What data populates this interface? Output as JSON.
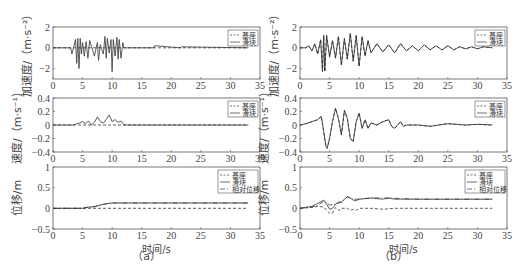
{
  "chart_data": [
    {
      "id": "a-acc",
      "panel": "a",
      "type": "line",
      "ylabel": "加速度/（m·s⁻²）",
      "xlabel": "",
      "xlim": [
        0,
        35
      ],
      "ylim": [
        -3,
        2
      ],
      "xticks": [
        0,
        5,
        10,
        15,
        20,
        25,
        30,
        35
      ],
      "yticks": [
        2,
        0,
        -2
      ],
      "legend": [
        "基座",
        "滑块"
      ],
      "legend_position": "upper right",
      "series": [
        {
          "name": "基座",
          "style": "dashed",
          "x": [
            0,
            3,
            33
          ],
          "y": [
            0,
            0,
            0
          ]
        },
        {
          "name": "滑块",
          "style": "solid",
          "x": [
            0,
            3,
            3.2,
            3.8,
            4,
            4.2,
            4.4,
            4.6,
            4.8,
            5,
            5.3,
            5.6,
            5.9,
            6.2,
            7,
            7.5,
            7.7,
            8,
            8.5,
            8.8,
            9,
            9.2,
            9.5,
            9.8,
            10,
            10.2,
            10.5,
            10.8,
            11,
            11.2,
            11.5,
            11.8,
            12,
            17,
            17.2,
            21.5,
            21.7,
            33
          ],
          "y": [
            0,
            0,
            -0.6,
            0.8,
            -1.5,
            0.9,
            -2,
            0.9,
            -0.6,
            0.5,
            -0.8,
            0.6,
            -1,
            0.7,
            -0.8,
            0.5,
            -1.2,
            0.3,
            -0.6,
            1.1,
            -1,
            0.9,
            -0.5,
            0.8,
            -2.3,
            0.8,
            -0.8,
            1,
            -1.1,
            0.8,
            -1,
            0.5,
            0,
            0,
            0.2,
            0,
            0.1,
            0
          ]
        }
      ]
    },
    {
      "id": "b-acc",
      "panel": "b",
      "type": "line",
      "ylabel": "加速度/（m·s⁻²）",
      "xlabel": "",
      "xlim": [
        0,
        35
      ],
      "ylim": [
        -3,
        2
      ],
      "xticks": [
        0,
        5,
        10,
        15,
        20,
        25,
        30,
        35
      ],
      "yticks": [
        2,
        0,
        -2
      ],
      "legend": [
        "基座",
        "滑块"
      ],
      "legend_position": "upper right",
      "series": [
        {
          "name": "基座",
          "style": "dashed",
          "x": [
            0,
            1,
            1.5,
            2,
            2.5,
            3,
            3.5,
            3.8,
            4,
            4.2,
            4.5,
            5,
            5.5,
            6,
            6.5,
            7,
            7.5,
            8,
            8.5,
            9,
            9.5,
            10,
            10.5,
            11,
            11.5,
            12,
            13,
            14,
            15,
            16,
            17,
            18,
            19,
            20,
            21,
            22,
            23,
            24,
            25,
            26,
            27,
            28,
            29,
            30,
            31,
            32.5
          ],
          "y": [
            0,
            0,
            0.2,
            -0.3,
            0.4,
            -0.6,
            0.8,
            -2.3,
            1.2,
            -2.3,
            1.2,
            -0.9,
            0.7,
            -1,
            1.1,
            -1.7,
            0.9,
            -1.1,
            1.4,
            -1.3,
            1.2,
            -1.8,
            1.1,
            -0.8,
            0.7,
            -0.5,
            0.4,
            -0.4,
            0.3,
            -0.5,
            0.4,
            -0.3,
            0.2,
            -0.3,
            0.3,
            -0.2,
            0.2,
            -0.2,
            0.2,
            -0.2,
            0.1,
            -0.1,
            0.1,
            -0.1,
            0.1,
            0
          ]
        },
        {
          "name": "滑块",
          "style": "solid",
          "note": "nearly coincides with 基座"
        }
      ]
    },
    {
      "id": "a-vel",
      "panel": "a",
      "type": "line",
      "ylabel": "速度/（m·s⁻¹）",
      "xlabel": "",
      "xlim": [
        0,
        35
      ],
      "ylim": [
        -0.4,
        0.4
      ],
      "xticks": [
        0,
        5,
        10,
        15,
        20,
        25,
        30,
        35
      ],
      "yticks": [
        0.4,
        0.2,
        0,
        -0.2,
        -0.4
      ],
      "legend": [
        "基座",
        "滑块"
      ],
      "legend_position": "upper right",
      "series": [
        {
          "name": "基座",
          "style": "dashed",
          "x": [
            0,
            33
          ],
          "y": [
            0,
            0
          ]
        },
        {
          "name": "滑块",
          "style": "solid",
          "x": [
            0,
            3.5,
            4,
            4.5,
            5,
            5.5,
            6,
            6.5,
            7,
            7.5,
            8,
            8.5,
            9,
            9.5,
            10,
            10.5,
            11,
            11.5,
            12,
            33
          ],
          "y": [
            0,
            0,
            0.02,
            0.03,
            0.05,
            0.02,
            0.06,
            0,
            0.04,
            0.12,
            0.05,
            0.03,
            0.08,
            0.15,
            0.05,
            0.08,
            0.04,
            0.06,
            0,
            0
          ]
        }
      ]
    },
    {
      "id": "b-vel",
      "panel": "b",
      "type": "line",
      "ylabel": "速度/（m·s⁻¹）",
      "xlabel": "",
      "xlim": [
        0,
        35
      ],
      "ylim": [
        -0.4,
        0.4
      ],
      "xticks": [
        0,
        5,
        10,
        15,
        20,
        25,
        30,
        35
      ],
      "yticks": [
        0.4,
        0.2,
        0,
        -0.2,
        -0.4
      ],
      "legend": [
        "基座",
        "滑块"
      ],
      "legend_position": "upper right",
      "series": [
        {
          "name": "基座",
          "style": "dashed",
          "x": [
            0,
            1,
            2,
            3,
            3.6,
            4,
            4.4,
            4.6,
            5,
            5.5,
            6,
            6.5,
            7,
            7.5,
            8,
            8.5,
            9,
            9.5,
            10,
            10.5,
            11,
            11.5,
            12,
            13,
            14,
            15,
            15.5,
            16,
            17,
            17.5,
            18,
            20,
            22,
            25,
            28,
            30,
            32.5
          ],
          "y": [
            0,
            0.02,
            0.05,
            0.08,
            0.13,
            -0.1,
            -0.33,
            -0.35,
            -0.2,
            0.05,
            0.25,
            0.1,
            -0.15,
            0.22,
            0.1,
            -0.2,
            -0.25,
            0.05,
            0.18,
            -0.05,
            0.08,
            -0.05,
            0.03,
            0,
            0.05,
            0.08,
            -0.02,
            -0.05,
            0.05,
            -0.02,
            0,
            0,
            -0.02,
            0.02,
            0,
            0.01,
            0
          ]
        },
        {
          "name": "滑块",
          "style": "solid",
          "note": "nearly coincides with 基座"
        }
      ]
    },
    {
      "id": "a-disp",
      "panel": "a",
      "type": "line",
      "ylabel": "位移/m",
      "xlabel": "时间/s",
      "xlim": [
        0,
        35
      ],
      "ylim": [
        -0.5,
        1
      ],
      "xticks": [
        0,
        5,
        10,
        15,
        20,
        25,
        30,
        35
      ],
      "yticks": [
        1,
        0.5,
        0,
        -0.5
      ],
      "legend": [
        "基座",
        "滑块",
        "相对位移"
      ],
      "legend_position": "upper right",
      "series": [
        {
          "name": "基座",
          "style": "dashed",
          "x": [
            0,
            33
          ],
          "y": [
            0,
            0
          ]
        },
        {
          "name": "滑块",
          "style": "solid",
          "x": [
            0,
            5,
            6,
            7,
            8,
            9,
            10,
            33
          ],
          "y": [
            0,
            0,
            0.03,
            0.04,
            0.08,
            0.11,
            0.13,
            0.13
          ]
        },
        {
          "name": "相对位移",
          "style": "dash-dot",
          "x": [
            0,
            5,
            6,
            7,
            8,
            9,
            10,
            33
          ],
          "y": [
            0,
            0,
            0.03,
            0.04,
            0.08,
            0.11,
            0.13,
            0.13
          ]
        }
      ]
    },
    {
      "id": "b-disp",
      "panel": "b",
      "type": "line",
      "ylabel": "位移/m",
      "xlabel": "时间/s",
      "xlim": [
        0,
        35
      ],
      "ylim": [
        -0.5,
        1
      ],
      "xticks": [
        0,
        5,
        10,
        15,
        20,
        25,
        30,
        35
      ],
      "yticks": [
        1,
        0.5,
        0,
        -0.5
      ],
      "legend": [
        "基座",
        "滑块",
        "相对位移"
      ],
      "legend_position": "upper right",
      "series": [
        {
          "name": "基座",
          "style": "dashed",
          "x": [
            0,
            2,
            3,
            4,
            4.5,
            5,
            5.5,
            6,
            6.5,
            7,
            8,
            8.5,
            9,
            9.5,
            10,
            12,
            14,
            16,
            20,
            25,
            32.5
          ],
          "y": [
            0,
            0.02,
            0.05,
            0.03,
            -0.05,
            -0.12,
            -0.12,
            0.02,
            -0.05,
            0,
            0,
            -0.05,
            -0.02,
            -0.05,
            0,
            0,
            -0.02,
            0,
            0,
            0,
            0
          ]
        },
        {
          "name": "滑块",
          "style": "solid",
          "x": [
            0,
            2,
            3,
            4,
            4.5,
            5,
            5.5,
            6,
            6.5,
            7,
            8,
            8.5,
            9,
            9.5,
            10,
            12,
            14,
            15,
            16,
            17,
            20,
            25,
            32.5
          ],
          "y": [
            0,
            0.05,
            0.12,
            0.2,
            0.1,
            -0.02,
            0,
            0.1,
            0.15,
            0.15,
            0.28,
            0.25,
            0.2,
            0.18,
            0.22,
            0.25,
            0.22,
            0.25,
            0.22,
            0.22,
            0.22,
            0.22,
            0.22
          ]
        },
        {
          "name": "相对位移",
          "style": "dash-dot",
          "x": [
            0,
            2,
            3,
            4,
            5,
            6,
            7,
            8,
            9,
            10,
            12,
            15,
            20,
            25,
            32.5
          ],
          "y": [
            0,
            0.03,
            0.07,
            0.17,
            0.08,
            0.1,
            0.15,
            0.28,
            0.22,
            0.22,
            0.25,
            0.25,
            0.22,
            0.22,
            0.22
          ]
        }
      ]
    }
  ],
  "captions": {
    "a": "（a）",
    "b": "（b）"
  },
  "labels": {
    "acc": "加速度/（m·s⁻²）",
    "vel": "速度/（m·s⁻¹）",
    "disp": "位移/m",
    "time": "时间/s"
  }
}
